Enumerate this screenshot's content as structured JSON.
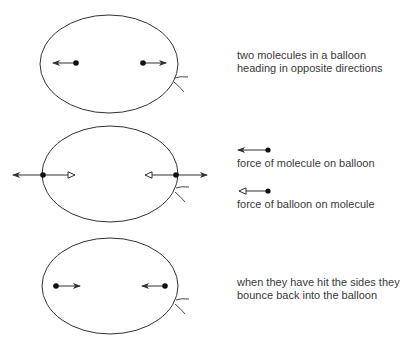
{
  "diagram": {
    "panels": [
      {
        "id": "before",
        "caption_lines": [
          "two molecules in a balloon",
          "heading in opposite directions"
        ]
      },
      {
        "id": "collision",
        "caption_lines": []
      },
      {
        "id": "after",
        "caption_lines": [
          "when they have hit the sides they",
          "bounce back into the balloon"
        ]
      }
    ],
    "legend": [
      {
        "symbol": "filled-arrowhead",
        "label": "force of molecule on balloon"
      },
      {
        "symbol": "open-arrowhead",
        "label": "force of balloon on molecule"
      }
    ],
    "colors": {
      "stroke": "#333333",
      "text": "#3a3a3a",
      "background": "#ffffff"
    }
  }
}
